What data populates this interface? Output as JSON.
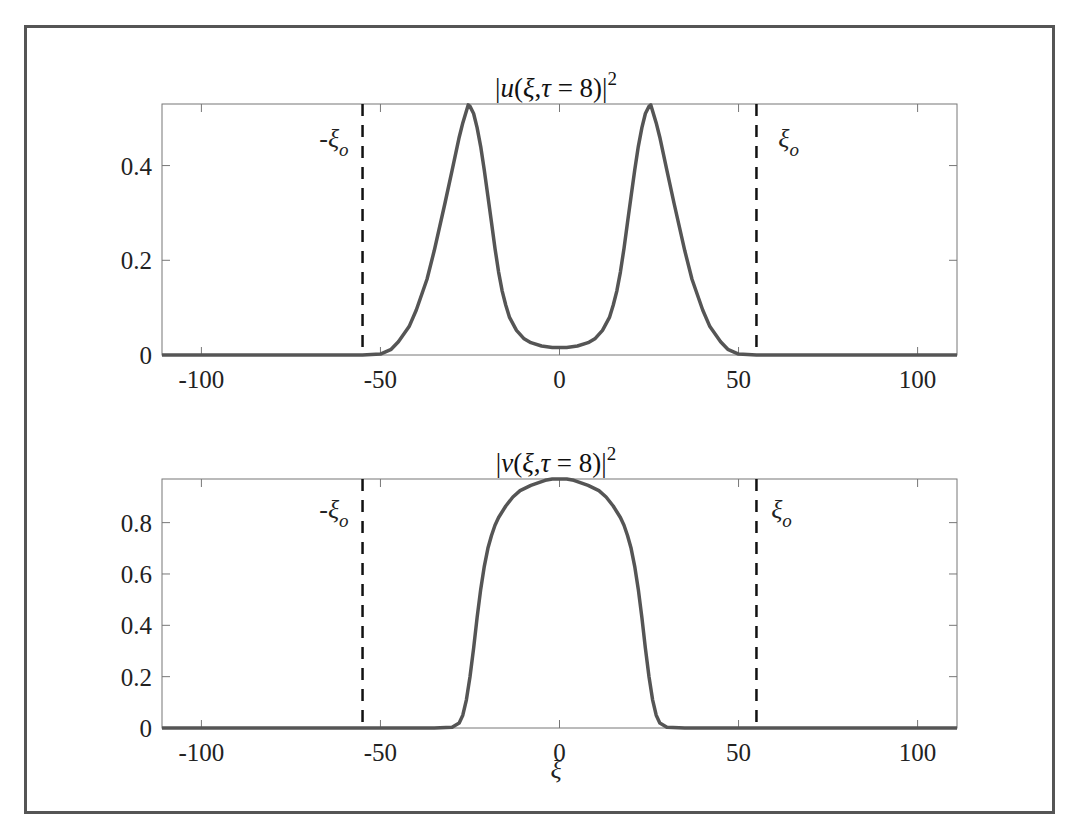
{
  "chart_data": [
    {
      "type": "line",
      "title": "|u(ξ,τ = 8)|²",
      "title_parts": {
        "prefix": "|",
        "func": "u",
        "args": "(ξ,τ = 8)|",
        "power": "2"
      },
      "xlabel": "",
      "ylabel": "",
      "xlim": [
        -111,
        111
      ],
      "ylim": [
        0,
        0.53
      ],
      "xticks": [
        -100,
        -50,
        0,
        50,
        100
      ],
      "xtick_labels": [
        "-100",
        "-50",
        "0",
        "50",
        "100"
      ],
      "yticks": [
        0,
        0.2,
        0.4
      ],
      "ytick_labels": [
        "0",
        "0.2",
        "0.4"
      ],
      "grid": false,
      "line_color": "#555555",
      "series": [
        {
          "name": "|u|^2",
          "x": [
            -111,
            -60,
            -55,
            -50,
            -47,
            -45,
            -42,
            -40,
            -37,
            -35,
            -32,
            -30,
            -28,
            -27,
            -26,
            -25.5,
            -25,
            -24,
            -23,
            -22,
            -21,
            -20,
            -19,
            -18,
            -17,
            -16,
            -15,
            -14,
            -12,
            -10,
            -8,
            -5,
            -2,
            0,
            2,
            5,
            8,
            10,
            12,
            14,
            15,
            16,
            17,
            18,
            19,
            20,
            21,
            22,
            23,
            24,
            25,
            25.5,
            26,
            27,
            28,
            30,
            32,
            35,
            37,
            40,
            42,
            45,
            47,
            50,
            55,
            60,
            111
          ],
          "values": [
            0,
            0,
            0,
            0.002,
            0.012,
            0.028,
            0.06,
            0.095,
            0.16,
            0.22,
            0.32,
            0.39,
            0.46,
            0.49,
            0.515,
            0.528,
            0.525,
            0.51,
            0.48,
            0.44,
            0.39,
            0.335,
            0.28,
            0.225,
            0.175,
            0.135,
            0.105,
            0.08,
            0.052,
            0.035,
            0.026,
            0.019,
            0.016,
            0.016,
            0.016,
            0.019,
            0.026,
            0.035,
            0.052,
            0.08,
            0.105,
            0.135,
            0.175,
            0.225,
            0.28,
            0.335,
            0.39,
            0.44,
            0.48,
            0.51,
            0.525,
            0.528,
            0.515,
            0.49,
            0.46,
            0.39,
            0.32,
            0.22,
            0.16,
            0.095,
            0.06,
            0.028,
            0.012,
            0.002,
            0,
            0,
            0
          ]
        }
      ],
      "vlines": [
        {
          "x": -55,
          "style": "dashed",
          "color": "#111111",
          "label": "-ξ",
          "label_sub": "o",
          "label_pos": [
            -63,
            0.44
          ]
        },
        {
          "x": 55,
          "style": "dashed",
          "color": "#111111",
          "label": "ξ",
          "label_sub": "o",
          "label_pos": [
            64,
            0.44
          ]
        }
      ]
    },
    {
      "type": "line",
      "title": "|v(ξ,τ = 8)|²",
      "title_parts": {
        "prefix": "|",
        "func": "v",
        "args": "(ξ,τ = 8)|",
        "power": "2"
      },
      "xlabel": "ξ",
      "ylabel": "",
      "xlim": [
        -111,
        111
      ],
      "ylim": [
        0,
        0.97
      ],
      "xticks": [
        -100,
        -50,
        0,
        50,
        100
      ],
      "xtick_labels": [
        "-100",
        "-50",
        "0",
        "50",
        "100"
      ],
      "yticks": [
        0,
        0.2,
        0.4,
        0.6,
        0.8
      ],
      "ytick_labels": [
        "0",
        "0.2",
        "0.4",
        "0.6",
        "0.8"
      ],
      "grid": false,
      "line_color": "#555555",
      "series": [
        {
          "name": "|v|^2",
          "x": [
            -111,
            -35,
            -30,
            -28,
            -27,
            -26,
            -25,
            -24,
            -23,
            -22,
            -21,
            -20,
            -19,
            -18,
            -17,
            -15,
            -13,
            -11,
            -8,
            -6,
            -4,
            -2,
            0,
            2,
            4,
            6,
            8,
            11,
            13,
            15,
            17,
            18,
            19,
            20,
            21,
            22,
            23,
            24,
            25,
            26,
            27,
            28,
            30,
            35,
            111
          ],
          "values": [
            0,
            0,
            0.003,
            0.02,
            0.05,
            0.11,
            0.2,
            0.31,
            0.43,
            0.54,
            0.63,
            0.7,
            0.75,
            0.79,
            0.82,
            0.865,
            0.9,
            0.925,
            0.945,
            0.955,
            0.965,
            0.97,
            0.97,
            0.97,
            0.965,
            0.955,
            0.945,
            0.925,
            0.9,
            0.865,
            0.82,
            0.79,
            0.75,
            0.7,
            0.63,
            0.54,
            0.43,
            0.31,
            0.2,
            0.11,
            0.05,
            0.02,
            0.003,
            0,
            0
          ]
        }
      ],
      "vlines": [
        {
          "x": -55,
          "style": "dashed",
          "color": "#111111",
          "label": "-ξ",
          "label_sub": "o",
          "label_pos": [
            -63,
            0.82
          ]
        },
        {
          "x": 55,
          "style": "dashed",
          "color": "#111111",
          "label": "ξ",
          "label_sub": "o",
          "label_pos": [
            62,
            0.82
          ]
        }
      ]
    }
  ]
}
